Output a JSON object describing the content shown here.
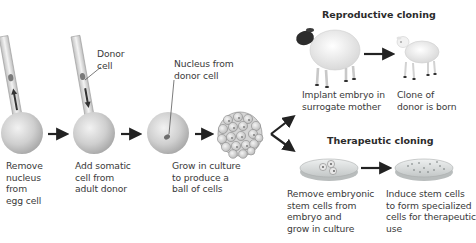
{
  "diagram": {
    "type": "flow",
    "steps": [
      {
        "id": "step1",
        "label_lines": [
          "Remove",
          "nucleus",
          "from",
          "egg cell"
        ]
      },
      {
        "id": "step2",
        "label_lines": [
          "Add somatic",
          "cell  from",
          "adult donor"
        ],
        "callout": [
          "Donor",
          "cell"
        ]
      },
      {
        "id": "step3",
        "label_lines": [
          "Nucleus from",
          "donor cell"
        ],
        "role": "callout"
      },
      {
        "id": "step4",
        "label_lines": [
          "Grow in culture",
          "to produce a",
          "ball of cells"
        ]
      }
    ],
    "branches": {
      "reproductive": {
        "heading": "Reproductive cloning",
        "steps": [
          {
            "label_lines": [
              "Implant embryo in",
              "surrogate mother"
            ]
          },
          {
            "label_lines": [
              "Clone of",
              "donor is born"
            ]
          }
        ]
      },
      "therapeutic": {
        "heading": "Therapeutic cloning",
        "steps": [
          {
            "label_lines": [
              "Remove embryonic",
              "stem cells from",
              "embryo and",
              "grow in culture"
            ]
          },
          {
            "label_lines": [
              "Induce stem cells",
              "to form specialized",
              "cells for therapeutic",
              "use"
            ]
          }
        ]
      }
    },
    "colors": {
      "cell": "#c9c9c9",
      "arrow": "#222222",
      "text": "#3a3a3a",
      "dish": "#d8dcdc"
    }
  }
}
